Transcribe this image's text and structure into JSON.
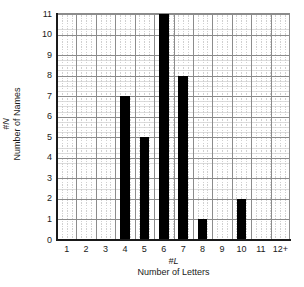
{
  "chart_data": {
    "type": "bar",
    "title": "",
    "subtitle": "",
    "xlabel": "Number of Letters",
    "xlabel_symbol": "#L",
    "ylabel": "Number of Names",
    "ylabel_symbol": "#N",
    "categories": [
      "1",
      "2",
      "3",
      "4",
      "5",
      "6",
      "7",
      "8",
      "9",
      "10",
      "11",
      "12+"
    ],
    "values": [
      0,
      0,
      0,
      7,
      5,
      11,
      8,
      1,
      0,
      2,
      0,
      0
    ],
    "xlim": [
      0.5,
      12.5
    ],
    "ylim": [
      0,
      11
    ],
    "yticks": [
      0,
      1,
      2,
      3,
      4,
      5,
      6,
      7,
      8,
      9,
      10,
      11
    ],
    "ytick_labels": [
      "0",
      "1",
      "2",
      "3",
      "4",
      "5",
      "6",
      "7",
      "8",
      "9",
      "10",
      "11"
    ],
    "xtick_labels": [
      "1",
      "2",
      "3",
      "4",
      "5",
      "6",
      "7",
      "8",
      "9",
      "10",
      "11",
      "12+"
    ],
    "grid": true,
    "grid_major_color": "#8c8c8c",
    "grid_minor_color": "#d0d0d0",
    "bar_color": "#000000",
    "background_color": "#ffffff",
    "legend": null,
    "legend_position": "none",
    "annotations": []
  }
}
